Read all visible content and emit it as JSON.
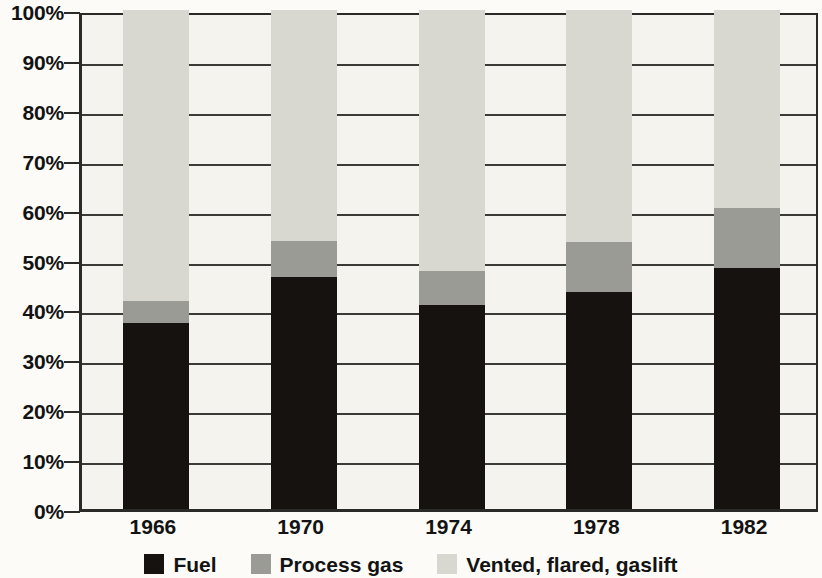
{
  "chart_data": {
    "type": "bar",
    "subtype": "stacked-percent",
    "title": "",
    "subtitle": "",
    "xlabel": "",
    "ylabel": "",
    "categories": [
      "1966",
      "1970",
      "1974",
      "1978",
      "1982"
    ],
    "series": [
      {
        "name": "Fuel",
        "color": "#151210",
        "values": [
          37.3,
          46.5,
          40.9,
          43.5,
          48.3
        ]
      },
      {
        "name": "Process gas",
        "color": "#9b9b96",
        "values": [
          4.4,
          7.2,
          6.8,
          10.0,
          12.0
        ]
      },
      {
        "name": "Vented, flared, gaslift",
        "color": "#d8d8d1",
        "values": [
          58.3,
          46.3,
          52.3,
          46.5,
          39.7
        ]
      }
    ],
    "cumulative_tops": {
      "fuel": [
        37.3,
        46.5,
        40.9,
        43.5,
        48.3
      ],
      "fuel_plus_process": [
        41.7,
        53.7,
        47.7,
        53.5,
        60.3
      ],
      "total": [
        100,
        100,
        100,
        100,
        100
      ]
    },
    "ylim": [
      0,
      100
    ],
    "ytick_values": [
      0,
      10,
      20,
      30,
      40,
      50,
      60,
      70,
      80,
      90,
      100
    ],
    "ytick_labels": [
      "0%",
      "10%",
      "20%",
      "30%",
      "40%",
      "50%",
      "60%",
      "70%",
      "80%",
      "90%",
      "100%"
    ],
    "grid": true,
    "grid_axis": "y",
    "legend_position": "bottom",
    "legend_entries": [
      "Fuel",
      "Process gas",
      "Vented, flared, gaslift"
    ]
  },
  "y_axis": {
    "ticks": [
      {
        "label": "100%",
        "value": 100
      },
      {
        "label": "90%",
        "value": 90
      },
      {
        "label": "80%",
        "value": 80
      },
      {
        "label": "70%",
        "value": 70
      },
      {
        "label": "60%",
        "value": 60
      },
      {
        "label": "50%",
        "value": 50
      },
      {
        "label": "40%",
        "value": 40
      },
      {
        "label": "30%",
        "value": 30
      },
      {
        "label": "20%",
        "value": 20
      },
      {
        "label": "10%",
        "value": 10
      },
      {
        "label": "0%",
        "value": 0
      }
    ]
  },
  "x_axis": {
    "ticks": [
      {
        "label": "1966"
      },
      {
        "label": "1970"
      },
      {
        "label": "1974"
      },
      {
        "label": "1978"
      },
      {
        "label": "1982"
      }
    ]
  },
  "legend": {
    "items": [
      {
        "label": "Fuel",
        "color": "#151210"
      },
      {
        "label": "Process gas",
        "color": "#9b9b96"
      },
      {
        "label": "Vented, flared, gaslift",
        "color": "#d8d8d1"
      }
    ]
  },
  "colors": {
    "fuel": "#151210",
    "process_gas": "#9b9b96",
    "vented_flared_gaslift": "#d8d8d1",
    "plot_background": "#f4f3ee",
    "axis": "#2a2a28",
    "gridline": "#3a3a37",
    "text": "#131313"
  }
}
